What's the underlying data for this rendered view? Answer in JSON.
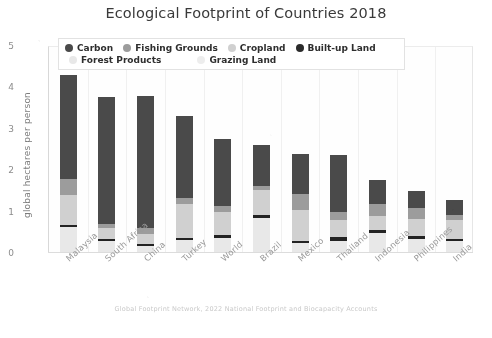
{
  "chart_data": {
    "type": "bar",
    "subtype": "stacked-bar",
    "title": "Ecological Footprint of Countries 2018",
    "xlabel": "",
    "ylabel": "global hectares per person",
    "ylim": [
      0,
      5
    ],
    "yticks": [
      0,
      1,
      2,
      3,
      4,
      5
    ],
    "ytick_labels": [
      "0",
      "1",
      "2",
      "3",
      "4",
      "5"
    ],
    "grid": false,
    "legend_position": "upper-center",
    "footnote": "Global Footprint Network, 2022 National Footprint and Biocapacity Accounts",
    "categories": [
      "Malaysia",
      "South Africa",
      "China",
      "Turkey",
      "World",
      "Brazil",
      "Mexico",
      "Thailand",
      "Indonesia",
      "Philippines",
      "India"
    ],
    "series": [
      {
        "name": "Forest Products",
        "color": "#e8e8e8",
        "values": [
          0.62,
          0.28,
          0.16,
          0.31,
          0.37,
          0.85,
          0.25,
          0.3,
          0.49,
          0.34,
          0.29
        ]
      },
      {
        "name": "Grazing Land",
        "color": "#232323",
        "values": [
          0.05,
          0.06,
          0.07,
          0.05,
          0.06,
          0.06,
          0.05,
          0.08,
          0.07,
          0.08,
          0.06
        ]
      },
      {
        "name": "Cropland",
        "color": "#d0d0d0",
        "values": [
          0.72,
          0.26,
          0.22,
          0.83,
          0.56,
          0.61,
          0.74,
          0.42,
          0.33,
          0.4,
          0.44
        ]
      },
      {
        "name": "Fishing Grounds",
        "color": "#9c9c9c",
        "values": [
          0.39,
          0.11,
          0.16,
          0.13,
          0.15,
          0.1,
          0.38,
          0.19,
          0.29,
          0.26,
          0.12
        ]
      },
      {
        "name": "Built-up Land",
        "color": "#2b2b2b",
        "values": [
          0.0,
          0.0,
          0.0,
          0.0,
          0.0,
          0.0,
          0.0,
          0.0,
          0.0,
          0.0,
          0.0
        ]
      },
      {
        "name": "Carbon",
        "color": "#4a4a4a",
        "values": [
          2.52,
          3.07,
          3.18,
          1.99,
          1.62,
          0.99,
          0.98,
          1.38,
          0.58,
          0.42,
          0.37
        ]
      }
    ],
    "totals": [
      4.3,
      3.78,
      3.79,
      3.31,
      2.76,
      2.61,
      2.4,
      2.37,
      1.76,
      1.5,
      1.28
    ]
  },
  "legend": {
    "entries": [
      {
        "label": "Carbon",
        "color": "#4a4a4a"
      },
      {
        "label": "Fishing Grounds",
        "color": "#9c9c9c"
      },
      {
        "label": "Cropland",
        "color": "#d0d0d0"
      },
      {
        "label": "Built-up Land",
        "color": "#2b2b2b"
      },
      {
        "label": "Forest Products",
        "color": "#e8e8e8"
      },
      {
        "label": "Grazing Land",
        "color": "#ededed"
      }
    ]
  }
}
